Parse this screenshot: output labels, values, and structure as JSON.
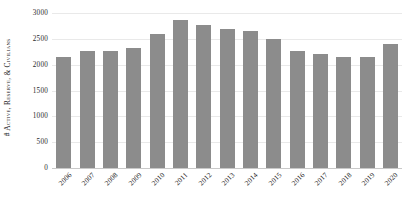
{
  "chart_data": {
    "type": "bar",
    "title": "",
    "xlabel": "",
    "ylabel": "# Active, Reserve, & Civilians",
    "ylim": [
      0,
      3000
    ],
    "ytick_values": [
      0,
      500,
      1000,
      1500,
      2000,
      2500,
      3000
    ],
    "ytick_labels": [
      "0",
      "500",
      "1000",
      "1500",
      "2000",
      "2500",
      "3000"
    ],
    "grid": true,
    "legend": false,
    "legend_position": "none",
    "bar_color": "#8c8c8c",
    "categories": [
      "2006",
      "2007",
      "2008",
      "2009",
      "2010",
      "2011",
      "2012",
      "2013",
      "2014",
      "2015",
      "2016",
      "2017",
      "2018",
      "2019",
      "2020"
    ],
    "values": [
      2155,
      2270,
      2270,
      2320,
      2600,
      2865,
      2760,
      2700,
      2660,
      2490,
      2270,
      2215,
      2155,
      2155,
      2400
    ]
  }
}
